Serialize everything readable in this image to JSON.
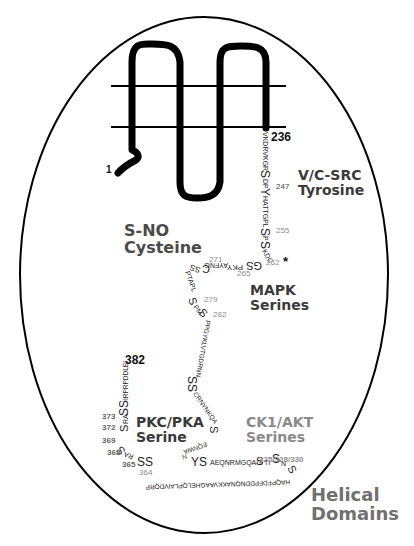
{
  "diagram": {
    "type": "protein topology schematic",
    "membrane_lines": 2,
    "terminus_labels": {
      "n_term": "1",
      "tm_end": "236",
      "c_term": "382"
    },
    "domain_labels": {
      "src": {
        "line1": "V/C-SRC",
        "line2": "Tyrosine"
      },
      "sno": {
        "line1": "S-NO",
        "line2": "Cysteine"
      },
      "mapk": {
        "line1": "MAPK",
        "line2": "Serines"
      },
      "pkc": {
        "line1": "PKC/PKA",
        "line2": "Serine"
      },
      "ck1": {
        "line1": "CK1/AKT",
        "line2": "Serines"
      },
      "helical": {
        "line1": "Helical",
        "line2": "Domains"
      }
    },
    "residue_numbers": {
      "r247": "247",
      "r255": "255",
      "r262": "262",
      "r262_marker": "*",
      "r265": "265",
      "r271": "271",
      "r279": "279",
      "r282": "282",
      "r325": "325/328/330",
      "r364": "364",
      "r365": "365",
      "r368": "368",
      "r369": "369",
      "r372": "372",
      "r373": "373"
    },
    "sequence_segments": {
      "s1": "VKDRVKGR",
      "s2": "S",
      "s3": "DP",
      "s4": "Y",
      "s5": "HATTGPL",
      "s6": "S",
      "s7": "P",
      "s8": "S",
      "s9": "KDC",
      "s10": "GS",
      "s11": "PKY",
      "s12": "AYFNG",
      "s13": "C",
      "s14": "SS",
      "s15": "PTAPL",
      "s16": "S",
      "s17": "PM",
      "s18": "S",
      "s19": "PPGYKLVTGDRNN",
      "s20": "SS",
      "s21": "CRNYNKQA",
      "s22": "S",
      "s23": "EQNWA",
      "s24": "N",
      "s25": "YS",
      "s26": "AEQNRMGQAG",
      "s27": "S",
      "s28": "TI",
      "s29": "S",
      "s30": "N",
      "s31": "S",
      "s32": "HAQPFDFPDDNQNAKKVAAGHELQPLAIVDQRP",
      "s33": "SS",
      "s34": "RA",
      "s35": "S",
      "s36": "S",
      "s37": "RA",
      "s38": "SS",
      "s39": "IRPRPDDLEI"
    }
  }
}
